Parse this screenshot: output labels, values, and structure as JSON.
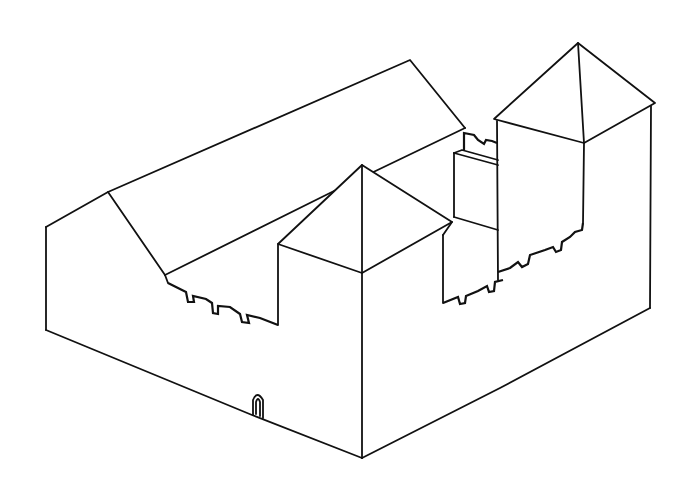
{
  "drawing": {
    "subject": "Castle line drawing",
    "style": "black ink outline on white",
    "colors": {
      "background": "#ffffff",
      "ink": "#111111"
    },
    "elements": [
      "west-hall-with-gabled-roof",
      "front-corner-tower-with-pyramid-roof",
      "rear-keep-tower-with-pyramid-roof",
      "inner-curtain-wall-block",
      "crenellated-battlements-west",
      "crenellated-battlements-east",
      "small-crenellation-rear",
      "arched-gate-doorway"
    ]
  }
}
